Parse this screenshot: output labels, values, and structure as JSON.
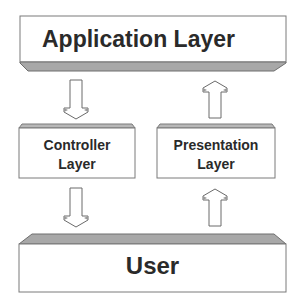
{
  "diagram": {
    "title": "",
    "nodes": [
      {
        "id": "application",
        "label": "Application Layer"
      },
      {
        "id": "controller",
        "label_line1": "Controller",
        "label_line2": "Layer"
      },
      {
        "id": "presentation",
        "label_line1": "Presentation",
        "label_line2": "Layer"
      },
      {
        "id": "user",
        "label": "User"
      }
    ],
    "edges": [
      {
        "from": "application",
        "to": "controller",
        "direction": "down"
      },
      {
        "from": "presentation",
        "to": "application",
        "direction": "up"
      },
      {
        "from": "controller",
        "to": "user",
        "direction": "down"
      },
      {
        "from": "user",
        "to": "presentation",
        "direction": "up"
      }
    ],
    "colors": {
      "box_fill": "#ffffff",
      "box_stroke": "#7a7a7a",
      "bevel_fill": "#a8a8a8",
      "text": "#2a2a2a",
      "arrow_stroke": "#6a6a6a"
    }
  }
}
